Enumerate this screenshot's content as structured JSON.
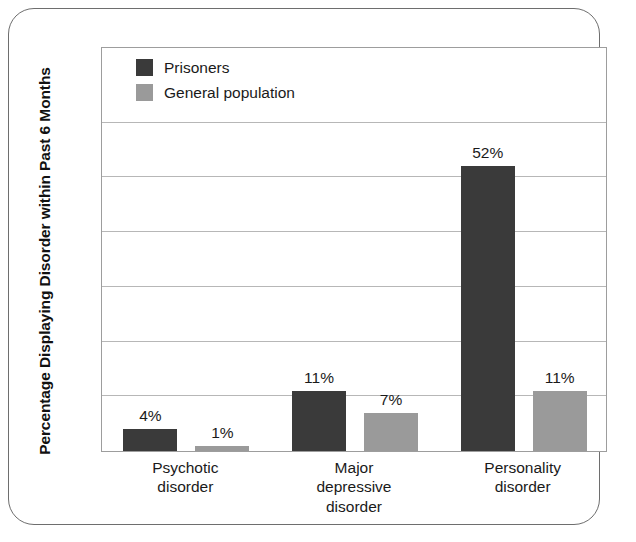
{
  "chart_data": {
    "type": "bar",
    "title": "",
    "xlabel": "",
    "ylabel": "Percentage Displaying Disorder within Past 6 Months",
    "categories": [
      "Psychotic disorder",
      "Major depressive disorder",
      "Personality disorder"
    ],
    "category_lines": [
      [
        "Psychotic",
        "disorder"
      ],
      [
        "Major",
        "depressive",
        "disorder"
      ],
      [
        "Personality",
        "disorder"
      ]
    ],
    "series": [
      {
        "name": "Prisoners",
        "color": "#3a3a3a",
        "values": [
          4,
          11,
          52
        ],
        "value_labels": [
          "4%",
          "11%",
          "52%"
        ]
      },
      {
        "name": "General population",
        "color": "#9a9a9a",
        "values": [
          1,
          7,
          11
        ],
        "value_labels": [
          "1%",
          "7%",
          "11%"
        ]
      }
    ],
    "ylim": [
      0,
      74
    ],
    "ytick_values": [
      0,
      10,
      20,
      30,
      40,
      50,
      60
    ],
    "ytick_labels_shown": false,
    "grid": true,
    "legend_position": "top-left-inside",
    "units": "percent"
  },
  "legend": {
    "items": [
      {
        "label": "Prisoners",
        "color": "#3a3a3a",
        "swatch": "legend-swatch-prisoners"
      },
      {
        "label": "General population",
        "color": "#9a9a9a",
        "swatch": "legend-swatch-general-population"
      }
    ]
  },
  "axes": {
    "y_title": "Percentage Displaying Disorder within Past 6 Months"
  },
  "colors": {
    "series_prisoners": "#3a3a3a",
    "series_general_population": "#9a9a9a",
    "gridline": "#b7b7b7",
    "plot_border": "#9d9d9d",
    "figure_border": "#6e6e6e",
    "background": "#ffffff",
    "text": "#1a1a1a"
  }
}
